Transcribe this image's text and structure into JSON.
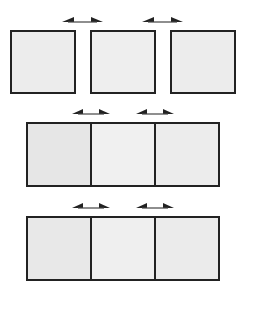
{
  "diagram": {
    "rows": [
      {
        "layout": "separated",
        "cells": [
          {
            "fill": "#ececec"
          },
          {
            "fill": "#eeeeee"
          },
          {
            "fill": "#ececec"
          }
        ],
        "arrows": [
          {
            "icon": "double-arrow-horizontal",
            "between": [
              1,
              2
            ]
          },
          {
            "icon": "double-arrow-horizontal",
            "between": [
              2,
              3
            ]
          }
        ]
      },
      {
        "layout": "joined",
        "cells": [
          {
            "fill": "#e6e6e6"
          },
          {
            "fill": "#f0f0f0"
          },
          {
            "fill": "#ececec"
          }
        ],
        "arrows": [
          {
            "icon": "double-arrow-horizontal",
            "between": [
              1,
              2
            ]
          },
          {
            "icon": "double-arrow-horizontal",
            "between": [
              2,
              3
            ]
          }
        ]
      },
      {
        "layout": "joined",
        "cells": [
          {
            "fill": "#e8e8e8"
          },
          {
            "fill": "#efefef"
          },
          {
            "fill": "#ebebeb"
          }
        ],
        "arrows": [
          {
            "icon": "double-arrow-horizontal",
            "between": [
              1,
              2
            ]
          },
          {
            "icon": "double-arrow-horizontal",
            "between": [
              2,
              3
            ]
          }
        ]
      }
    ],
    "colors": {
      "stroke": "#222222",
      "background": "#ffffff"
    }
  }
}
